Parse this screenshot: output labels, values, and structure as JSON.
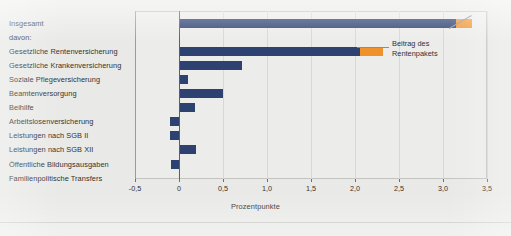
{
  "chart_data": {
    "type": "bar",
    "orientation": "horizontal",
    "title": "",
    "xlabel": "Prozentpunkte",
    "ylabel": "",
    "xlim": [
      -0.5,
      3.5
    ],
    "xticks": [
      "-0,5",
      "0",
      "0,5",
      "1,0",
      "1,5",
      "2,0",
      "2,5",
      "3,0",
      "3,5"
    ],
    "xtick_values": [
      -0.5,
      0,
      0.5,
      1.0,
      1.5,
      2.0,
      2.5,
      3.0,
      3.5
    ],
    "grid": true,
    "legend_position": "none",
    "annotation": "Beitrag des Rentenpakets",
    "colors": {
      "base": "#2e4272",
      "rentenpaket": "#f0922b",
      "background": "#e9e9e7",
      "axis": "#5d5d5b",
      "grid": "#d7d7d4"
    },
    "series": [
      {
        "name": "Basis",
        "color": "#2e4272"
      },
      {
        "name": "Beitrag des Rentenpakets",
        "color": "#f0922b"
      }
    ],
    "categories": [
      "Insgesamt",
      "davon:",
      "Gesetzliche Rentenversicherung",
      "Gesetzliche Krankenversicherung",
      "Soziale Pflegeversicherung",
      "Beamtenversorgung",
      "Beihilfe",
      "Arbeitslosenversicherung",
      "Leistungen nach SGB II",
      "Leistungen nach SGB XII",
      "Öffentliche Bildungsausgaben",
      "Familienpolitische Transfers"
    ],
    "bars": [
      {
        "category": "Insgesamt",
        "base": 3.15,
        "rentenpaket": 0.18,
        "total": 3.33
      },
      {
        "category": "davon:",
        "base": null,
        "rentenpaket": null,
        "total": null
      },
      {
        "category": "Gesetzliche Rentenversicherung",
        "base": 2.06,
        "rentenpaket": 0.26,
        "total": 2.32
      },
      {
        "category": "Gesetzliche Krankenversicherung",
        "base": 0.72,
        "rentenpaket": 0,
        "total": 0.72
      },
      {
        "category": "Soziale Pflegeversicherung",
        "base": 0.1,
        "rentenpaket": 0,
        "total": 0.1
      },
      {
        "category": "Beamtenversorgung",
        "base": 0.5,
        "rentenpaket": 0,
        "total": 0.5
      },
      {
        "category": "Beihilfe",
        "base": 0.18,
        "rentenpaket": 0,
        "total": 0.18
      },
      {
        "category": "Arbeitslosenversicherung",
        "base": -0.1,
        "rentenpaket": 0,
        "total": -0.1
      },
      {
        "category": "Leistungen nach SGB II",
        "base": -0.1,
        "rentenpaket": 0,
        "total": -0.1
      },
      {
        "category": "Leistungen nach SGB XII",
        "base": 0.19,
        "rentenpaket": 0,
        "total": 0.19
      },
      {
        "category": "Öffentliche Bildungsausgaben",
        "base": -0.09,
        "rentenpaket": 0,
        "total": -0.09
      },
      {
        "category": "Familienpolitische Transfers",
        "base": 0,
        "rentenpaket": 0,
        "total": 0
      }
    ]
  },
  "footer": {
    "caption_clipped": "· · ·  ·· · ·· ·  ·· · · ·  · ·· ·  · · ··  · ··· · ·  · · · ··· · ·"
  }
}
